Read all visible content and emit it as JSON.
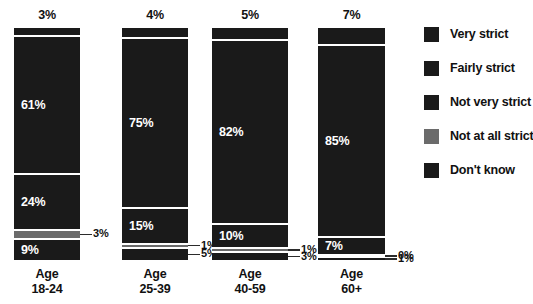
{
  "chart_data": {
    "type": "bar",
    "subtype": "stacked-column-100",
    "title": "",
    "subtitle": "",
    "xlabel": "",
    "ylabel": "",
    "ylim": [
      0,
      100
    ],
    "grid": false,
    "legend_position": "right",
    "categories": [
      "Age 18-24",
      "Age 25-39",
      "Age 40-59",
      "Age 60+"
    ],
    "category_lines": [
      [
        "Age",
        "18-24"
      ],
      [
        "Age",
        "25-39"
      ],
      [
        "Age",
        "40-59"
      ],
      [
        "Age",
        "60+"
      ]
    ],
    "series": [
      {
        "name": "Very strict",
        "color": "#1a1a1a",
        "values": [
          3,
          4,
          5,
          7
        ],
        "labels": [
          "3%",
          "4%",
          "5%",
          "7%"
        ]
      },
      {
        "name": "Fairly strict",
        "color": "#1a1a1a",
        "values": [
          61,
          75,
          82,
          85
        ],
        "labels": [
          "61%",
          "75%",
          "82%",
          "85%"
        ]
      },
      {
        "name": "Not very strict",
        "color": "#1a1a1a",
        "values": [
          24,
          15,
          10,
          7
        ],
        "labels": [
          "24%",
          "15%",
          "10%",
          "7%"
        ]
      },
      {
        "name": "Not at all strict",
        "color": "#6b6b6b",
        "values": [
          3,
          1,
          1,
          0
        ],
        "labels": [
          "3%",
          "1%",
          "1%",
          "0%"
        ]
      },
      {
        "name": "Don't know",
        "color": "#1a1a1a",
        "values": [
          9,
          5,
          3,
          1
        ],
        "labels": [
          "9%",
          "5%",
          "3%",
          "1%"
        ]
      }
    ]
  },
  "legend": {
    "items": [
      {
        "label": "Very strict",
        "color": "#1a1a1a"
      },
      {
        "label": "Fairly strict",
        "color": "#1a1a1a"
      },
      {
        "label": "Not very strict",
        "color": "#1a1a1a"
      },
      {
        "label": "Not at all strict",
        "color": "#6b6b6b"
      },
      {
        "label": "Don't know",
        "color": "#1a1a1a"
      }
    ]
  },
  "colors": {
    "background": "#ffffff",
    "bar_dark": "#1a1a1a",
    "bar_grey": "#6b6b6b",
    "text": "#111111",
    "inline_label": "#ffffff"
  }
}
